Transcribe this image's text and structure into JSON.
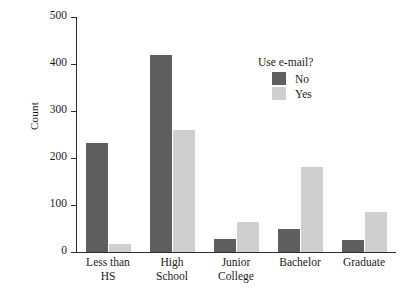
{
  "chart_data": {
    "type": "bar",
    "title": "",
    "xlabel": "",
    "ylabel": "Count",
    "ylim": [
      0,
      500
    ],
    "yticks": [
      0,
      100,
      200,
      300,
      400,
      500
    ],
    "grid": false,
    "legend": {
      "title": "Use e-mail?",
      "position": "top-right-inside",
      "entries": [
        {
          "name": "No",
          "color": "#5e5e5e"
        },
        {
          "name": "Yes",
          "color": "#cfcfcf"
        }
      ]
    },
    "categories": [
      {
        "lines": [
          "Less than",
          "HS"
        ]
      },
      {
        "lines": [
          "High",
          "School"
        ]
      },
      {
        "lines": [
          "Junior",
          "College"
        ]
      },
      {
        "lines": [
          "Bachelor"
        ]
      },
      {
        "lines": [
          "Graduate"
        ]
      }
    ],
    "series": [
      {
        "name": "No",
        "color": "#5e5e5e",
        "values": [
          232,
          420,
          28,
          50,
          25
        ]
      },
      {
        "name": "Yes",
        "color": "#cfcfcf",
        "values": [
          18,
          260,
          64,
          181,
          85
        ]
      }
    ]
  }
}
